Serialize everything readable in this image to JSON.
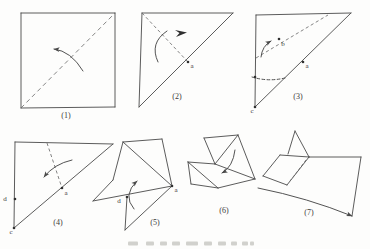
{
  "figure": {
    "bg": "#fdfdfc",
    "stroke": "#4a4a4a",
    "dash_stroke": "#6e6e6e",
    "dot_color": "#303030",
    "label_color": "#3a3a3a",
    "steps": [
      {
        "name": "step-1",
        "label": "(1)",
        "label_pos": [
          66,
          118
        ],
        "solid": [
          [
            [
              21,
              13
            ],
            [
              115,
              13
            ]
          ],
          [
            [
              115,
              13
            ],
            [
              115,
              107
            ]
          ],
          [
            [
              115,
              107
            ],
            [
              21,
              108
            ]
          ],
          [
            [
              21,
              108
            ],
            [
              21,
              13
            ]
          ]
        ],
        "dashed": [
          [
            [
              21,
              108
            ],
            [
              115,
              13
            ],
            "4.4,3.4"
          ]
        ],
        "dots": [],
        "letters": [],
        "arrows": [
          {
            "tail": [
              83,
              71
            ],
            "ctrl": [
              71,
              51
            ],
            "tip": [
              54,
              49
            ],
            "head": true
          }
        ],
        "darts": []
      },
      {
        "name": "step-2",
        "label": "(2)",
        "label_pos": [
          177,
          99
        ],
        "solid": [
          [
            [
              142,
              13
            ],
            [
              233,
              13
            ]
          ],
          [
            [
              142,
              13
            ],
            [
              139,
              107
            ]
          ],
          [
            [
              139,
              107
            ],
            [
              233,
              13
            ]
          ]
        ],
        "dashed": [
          [
            [
              142,
              13
            ],
            [
              188,
              62
            ]
          ]
        ],
        "dots": [
          [
            188,
            62
          ]
        ],
        "letters": [
          {
            "t": "a",
            "p": [
              192,
              68
            ]
          }
        ],
        "arrows": [
          {
            "tail": [
              158,
              62
            ],
            "ctrl": [
              149,
              43
            ],
            "tip": [
              167,
              31
            ],
            "head": false
          }
        ],
        "darts": [
          [
            [
              175,
              30
            ],
            [
              187,
              32.5
            ],
            [
              176,
              37
            ],
            [
              179.5,
              33
            ]
          ]
        ]
      },
      {
        "name": "step-3",
        "label": "(3)",
        "label_pos": [
          298,
          99
        ],
        "solid": [
          [
            [
              256,
              15
            ],
            [
              255,
              107
            ]
          ],
          [
            [
              256,
              15
            ],
            [
              351,
              13
            ]
          ],
          [
            [
              255,
              107
            ],
            [
              351,
              13
            ]
          ]
        ],
        "dashed": [
          [
            [
              256,
              58
            ],
            [
              328,
              15
            ]
          ]
        ],
        "dots": [
          [
            255,
            77
          ],
          [
            279,
            39
          ],
          [
            303,
            62
          ],
          [
            255,
            107
          ]
        ],
        "letters": [
          {
            "t": "b",
            "p": [
              283,
              46
            ]
          },
          {
            "t": "a",
            "p": [
              307,
              68
            ]
          },
          {
            "t": "c",
            "p": [
              252,
              113
            ]
          }
        ],
        "arrows": [
          {
            "tail": [
              261,
              57
            ],
            "ctrl": [
              262,
              46
            ],
            "tip": [
              271,
              41
            ],
            "head": true
          },
          {
            "tail": [
              252,
              77
            ],
            "ctrl": [
              268,
              82
            ],
            "tip": [
              285,
              78
            ],
            "head": false,
            "dashed": true
          }
        ],
        "darts": []
      },
      {
        "name": "step-4",
        "label": "(4)",
        "label_pos": [
          58,
          225
        ],
        "solid": [
          [
            [
              15,
              142
            ],
            [
              113,
              144
            ]
          ],
          [
            [
              15,
              142
            ],
            [
              14,
              228
            ]
          ],
          [
            [
              14,
              228
            ],
            [
              113,
              144
            ]
          ]
        ],
        "dashed": [
          [
            [
              47,
              143
            ],
            [
              62,
              188
            ]
          ]
        ],
        "dots": [
          [
            15,
            199
          ],
          [
            62,
            188
          ],
          [
            14,
            228
          ]
        ],
        "letters": [
          {
            "t": "d",
            "p": [
              5,
              201
            ]
          },
          {
            "t": "a",
            "p": [
              66,
              195
            ]
          },
          {
            "t": "c",
            "p": [
              11,
              234
            ]
          }
        ],
        "arrows": [
          {
            "tail": [
              72,
              160
            ],
            "ctrl": [
              54,
              164
            ],
            "tip": [
              44,
              177
            ],
            "head": true
          }
        ],
        "darts": []
      },
      {
        "name": "step-5",
        "label": "(5)",
        "label_pos": [
          155,
          225
        ],
        "solid": [
          [
            [
              123,
              142
            ],
            [
              162,
              139
            ]
          ],
          [
            [
              162,
              139
            ],
            [
              172,
              186
            ]
          ],
          [
            [
              123,
              142
            ],
            [
              113,
              180
            ]
          ],
          [
            [
              113,
              180
            ],
            [
              93,
              201
            ]
          ],
          [
            [
              93,
              201
            ],
            [
              172,
              186
            ]
          ],
          [
            [
              123,
              142
            ],
            [
              172,
              186
            ]
          ],
          [
            [
              127,
              197
            ],
            [
              125,
              230
            ]
          ],
          [
            [
              125,
              230
            ],
            [
              172,
              186
            ]
          ]
        ],
        "dashed": [],
        "dots": [
          [
            127,
            197
          ],
          [
            172,
            186
          ]
        ],
        "letters": [
          {
            "t": "d",
            "p": [
              119,
              203
            ]
          },
          {
            "t": "a",
            "p": [
              176,
              192
            ]
          }
        ],
        "arrows": [
          {
            "tail": [
              134,
              209
            ],
            "ctrl": [
              122,
              195
            ],
            "tip": [
              137,
              181
            ],
            "head": true
          }
        ],
        "darts": []
      },
      {
        "name": "step-6",
        "label": "(6)",
        "label_pos": [
          224,
          213
        ],
        "solid": [
          [
            [
              204,
              138
            ],
            [
              238,
              135
            ]
          ],
          [
            [
              238,
              135
            ],
            [
              255,
              179
            ]
          ],
          [
            [
              204,
              138
            ],
            [
              215,
              164
            ]
          ],
          [
            [
              188,
              162
            ],
            [
              215,
              164
            ]
          ],
          [
            [
              215,
              164
            ],
            [
              255,
              179
            ]
          ],
          [
            [
              188,
              162
            ],
            [
              191,
              184
            ]
          ],
          [
            [
              191,
              184
            ],
            [
              218,
              188
            ]
          ],
          [
            [
              218,
              188
            ],
            [
              188,
              162
            ]
          ],
          [
            [
              218,
              188
            ],
            [
              255,
              179
            ]
          ],
          [
            [
              215,
              164
            ],
            [
              238,
              135
            ]
          ]
        ],
        "dashed": [],
        "dots": [],
        "letters": [],
        "arrows": [
          {
            "tail": [
              235,
              150
            ],
            "ctrl": [
              233,
              167
            ],
            "tip": [
              222,
              173
            ],
            "head": true
          }
        ],
        "darts": []
      },
      {
        "name": "step-7",
        "label": "(7)",
        "label_pos": [
          309,
          215
        ],
        "solid": [
          [
            [
              295,
              131
            ],
            [
              288,
              154
            ]
          ],
          [
            [
              295,
              131
            ],
            [
              309,
              157
            ]
          ],
          [
            [
              280,
              155
            ],
            [
              309,
              157
            ]
          ],
          [
            [
              309,
              157
            ],
            [
              361,
              157
            ]
          ],
          [
            [
              361,
              157
            ],
            [
              352,
              216
            ]
          ],
          [
            [
              280,
              155
            ],
            [
              263,
              176
            ]
          ],
          [
            [
              263,
              176
            ],
            [
              287,
              185
            ]
          ],
          [
            [
              287,
              185
            ],
            [
              309,
              157
            ]
          ]
        ],
        "dashed": [
          [
            [
              306,
              160
            ],
            [
              290,
              181
            ],
            "2.6,2.2"
          ]
        ],
        "dots": [],
        "letters": [],
        "arrows": [
          {
            "tail": [
              258,
              188
            ],
            "ctrl": [
              308,
              198
            ],
            "tip": [
              352,
              216
            ],
            "head": true
          }
        ],
        "darts": []
      }
    ],
    "caption": {
      "y": 241.5,
      "h": 4,
      "color": "#c9c9c4",
      "items": [
        [
          128,
          10
        ],
        [
          146,
          8
        ],
        [
          160,
          7
        ],
        [
          172,
          8
        ],
        [
          186,
          12
        ],
        [
          204,
          8
        ],
        [
          218,
          8
        ],
        [
          231,
          6
        ],
        [
          242,
          6
        ],
        [
          250,
          4
        ]
      ]
    }
  }
}
